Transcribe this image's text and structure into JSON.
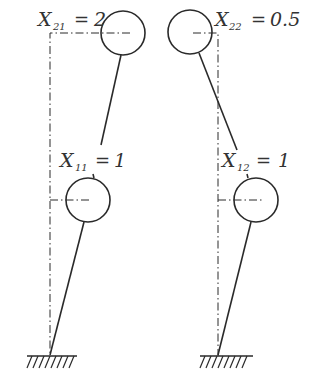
{
  "diagram": {
    "type": "mechanical-linkage",
    "colors": {
      "stroke": "#2a2a2a",
      "text": "#333333",
      "background": "#ffffff"
    },
    "left_mechanism": {
      "upper_label": {
        "var": "X",
        "sub": "21",
        "eq": "=",
        "value": "2"
      },
      "lower_label": {
        "var": "X",
        "sub": "11",
        "eq": "=",
        "value": "1"
      }
    },
    "right_mechanism": {
      "upper_label": {
        "var": "X",
        "sub": "22",
        "eq": "=",
        "value": "0.5"
      },
      "lower_label": {
        "var": "X",
        "sub": "12",
        "eq": "=",
        "value": "1"
      }
    }
  }
}
